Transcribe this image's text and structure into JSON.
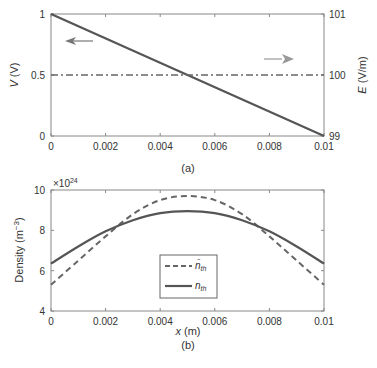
{
  "chart_data": [
    {
      "type": "line",
      "panel_label": "(a)",
      "xlabel": "",
      "ylabel": "V (V)",
      "ylabel_right": "E (V/m)",
      "xlim": [
        0,
        0.01
      ],
      "ylim": [
        0,
        1
      ],
      "ylim_right": [
        99,
        101
      ],
      "x_ticks": [
        "0",
        "0.002",
        "0.004",
        "0.006",
        "0.008",
        "0.01"
      ],
      "y_ticks": [
        "0",
        "0.5",
        "1"
      ],
      "y_ticks_right": [
        "99",
        "100",
        "101"
      ],
      "series": [
        {
          "name": "V",
          "axis": "left",
          "style": "solid",
          "x": [
            0,
            0.01
          ],
          "values": [
            1,
            0
          ]
        },
        {
          "name": "E",
          "axis": "right",
          "style": "dash-dot",
          "x": [
            0,
            0.01
          ],
          "values": [
            100,
            100
          ]
        }
      ],
      "annotations": [
        "left arrow near V line (left axis)",
        "right arrow near E line (right axis)"
      ]
    },
    {
      "type": "line",
      "panel_label": "(b)",
      "xlabel": "x (m)",
      "ylabel": "Density (m^-3)",
      "y_multiplier": "×10^24",
      "xlim": [
        0,
        0.01
      ],
      "ylim": [
        4,
        10
      ],
      "x_ticks": [
        "0",
        "0.002",
        "0.004",
        "0.006",
        "0.008",
        "0.01"
      ],
      "y_ticks": [
        "4",
        "6",
        "8",
        "10"
      ],
      "legend": [
        "n̄_th",
        "n_th"
      ],
      "legend_position": "center-left",
      "series": [
        {
          "name": "n̄_th",
          "style": "dashed",
          "x": [
            0,
            0.001,
            0.002,
            0.003,
            0.004,
            0.005,
            0.006,
            0.007,
            0.008,
            0.009,
            0.01
          ],
          "values": [
            5.3,
            6.5,
            7.7,
            8.8,
            9.5,
            9.7,
            9.5,
            8.8,
            7.7,
            6.5,
            5.3
          ]
        },
        {
          "name": "n_th",
          "style": "solid",
          "x": [
            0,
            0.001,
            0.002,
            0.003,
            0.004,
            0.005,
            0.006,
            0.007,
            0.008,
            0.009,
            0.01
          ],
          "values": [
            6.35,
            7.2,
            7.95,
            8.5,
            8.85,
            8.95,
            8.85,
            8.5,
            7.95,
            7.2,
            6.35
          ]
        }
      ]
    }
  ],
  "labels": {
    "a_ylabel_italic": "V",
    "a_ylabel_unit": " (V)",
    "a_ylabel_right_italic": "E",
    "a_ylabel_right_unit": " (V/m)",
    "a_panel": "(a)",
    "b_panel": "(b)",
    "b_xlabel_italic": "x",
    "b_xlabel_unit": " (m)",
    "b_ylabel": "Density (m",
    "b_ylabel_sup": "−3",
    "b_ylabel_end": ")",
    "b_mult": "×10",
    "b_mult_sup": "24",
    "legend_1": "n̄",
    "legend_1_sub": "th",
    "legend_2": "n",
    "legend_2_sub": "th"
  },
  "colors": {
    "line": "#555555",
    "axis": "#777777",
    "dashed": "#666666"
  }
}
